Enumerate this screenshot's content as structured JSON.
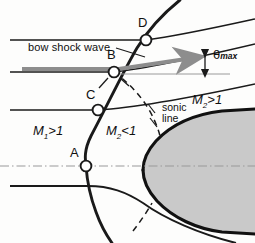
{
  "figure": {
    "background_color": "#fdfdfc"
  },
  "colors": {
    "line": "#1a1a1a",
    "body_fill": "#c9c9c9",
    "body_outline": "#111111",
    "streamline_arrow": "#8d8d8d",
    "centerline": "#9a9a9a",
    "text": "#101010"
  },
  "labels": {
    "bow_shock_wave": "bow shock wave",
    "sonic_line_1": "sonic",
    "sonic_line_2": "line",
    "theta_max_symbol": "θ",
    "theta_max_sub": "max",
    "mach_upstream": "M",
    "mach_upstream_sub": "1",
    "mach_upstream_rel": ">1",
    "mach_subsonic": "M",
    "mach_subsonic_sub": "2",
    "mach_subsonic_rel": "<1",
    "mach_supersonic": "M",
    "mach_supersonic_sub": "2",
    "mach_supersonic_rel": ">1",
    "point_a": "A",
    "point_b": "B",
    "point_c": "C",
    "point_d": "D"
  },
  "points": [
    {
      "id": "A",
      "label": "A",
      "x": 86,
      "y": 166,
      "label_x": 71,
      "label_y": 150
    },
    {
      "id": "B",
      "label": "B",
      "x": 114,
      "y": 72,
      "label_x": 108,
      "label_y": 51
    },
    {
      "id": "C",
      "label": "C",
      "x": 98,
      "y": 110,
      "label_x": 87,
      "label_y": 92
    },
    {
      "id": "D",
      "label": "D",
      "x": 146,
      "y": 40,
      "label_x": 138,
      "label_y": 18
    }
  ],
  "annotations": {
    "bow_shock_wave_leader": "line from label to shock at point B region",
    "theta_max_description": "flow deflection angle between incoming and deflected streamline at B",
    "sonic_line_description": "dashed curve separating subsonic and supersonic post-shock flow",
    "centerline_description": "dash-dot axis of symmetry through stagnation point A"
  },
  "regions": [
    {
      "name": "upstream-supersonic",
      "mach_label": "M1>1"
    },
    {
      "name": "post-shock-subsonic",
      "mach_label": "M2<1"
    },
    {
      "name": "post-shock-supersonic",
      "mach_label": "M2>1"
    }
  ]
}
